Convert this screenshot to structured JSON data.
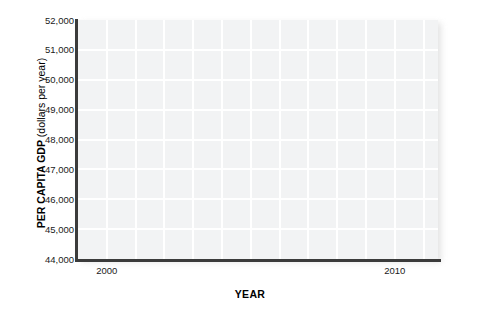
{
  "chart_data": {
    "type": "line",
    "title": "",
    "subtitle": "",
    "xlabel": "YEAR",
    "ylabel_bold": "PER CAPITA GDP",
    "ylabel_regular": " (dollars per year)",
    "ylabel_full": "PER CAPITA GDP (dollars per year)",
    "xlim": [
      1999,
      2011.5
    ],
    "ylim": [
      44000,
      52000
    ],
    "x_tick_values": [
      2000,
      2010
    ],
    "x_tick_labels": [
      "2000",
      "2010"
    ],
    "y_tick_values": [
      44000,
      45000,
      46000,
      47000,
      48000,
      49000,
      50000,
      51000,
      52000
    ],
    "y_tick_labels": [
      "44,000",
      "45,000",
      "46,000",
      "47,000",
      "48,000",
      "49,000",
      "50,000",
      "51,000",
      "52,000"
    ],
    "grid": true,
    "grid_color": "#ffffff",
    "plot_background": "#f2f3f4",
    "axis_color": "#3b3b3b",
    "legend": null,
    "series": [],
    "values": [],
    "annotations": [],
    "note": "Blank axes template — no data series plotted"
  },
  "figure": {
    "background": "#ffffff"
  }
}
